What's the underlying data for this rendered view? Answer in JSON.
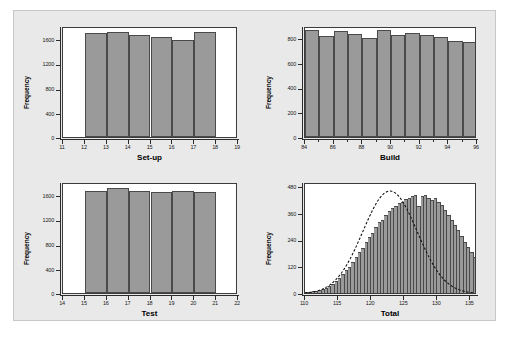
{
  "figure": {
    "panel_background": "#e9e9e9",
    "plot_background": "#ffffff",
    "bar_fill": "#9a9a9a",
    "bar_edge": "#4a4a4a",
    "axis_color": "#2b2b2b"
  },
  "chart_data": [
    {
      "type": "bar",
      "title": "",
      "xlabel": "Set-up",
      "ylabel": "Frequency",
      "xlim": [
        11,
        19
      ],
      "ylim": [
        0,
        1800
      ],
      "xticks": [
        11,
        12,
        13,
        14,
        15,
        16,
        17,
        18,
        19
      ],
      "xtick_labels": [
        "11",
        "12",
        "13",
        "14",
        "15",
        "16",
        "17",
        "18",
        "19"
      ],
      "yticks": [
        0,
        400,
        800,
        1200,
        1600
      ],
      "ytick_labels": [
        "0",
        "400",
        "800",
        "1200",
        "1600"
      ],
      "bin_edges": [
        12,
        13,
        14,
        15,
        16,
        17,
        18
      ],
      "categories": [
        "12-13",
        "13-14",
        "14-15",
        "15-16",
        "16-17",
        "17-18"
      ],
      "values": [
        1690,
        1705,
        1650,
        1630,
        1570,
        1700
      ],
      "grid": false,
      "legend": "none"
    },
    {
      "type": "bar",
      "title": "",
      "xlabel": "Build",
      "ylabel": "Frequency",
      "xlim": [
        84,
        96
      ],
      "ylim": [
        0,
        900
      ],
      "xticks": [
        84,
        85,
        86,
        87,
        88,
        89,
        90,
        91,
        92,
        93,
        94,
        95,
        96
      ],
      "xtick_labels": [
        "84",
        "",
        "86",
        "",
        "88",
        "",
        "90",
        "",
        "92",
        "",
        "94",
        "",
        "96"
      ],
      "yticks": [
        0,
        200,
        400,
        600,
        800
      ],
      "ytick_labels": [
        "0",
        "200",
        "400",
        "600",
        "800"
      ],
      "bin_edges": [
        84,
        85,
        86,
        87,
        88,
        89,
        90,
        91,
        92,
        93,
        94,
        95,
        96
      ],
      "categories": [
        "84-85",
        "85-86",
        "86-87",
        "87-88",
        "88-89",
        "89-90",
        "90-91",
        "91-92",
        "92-93",
        "93-94",
        "94-95",
        "95-96"
      ],
      "values": [
        872,
        823,
        858,
        838,
        806,
        872,
        828,
        845,
        828,
        812,
        782,
        768
      ],
      "grid": false,
      "legend": "none"
    },
    {
      "type": "bar",
      "title": "",
      "xlabel": "Test",
      "ylabel": "Frequency",
      "xlim": [
        14,
        22
      ],
      "ylim": [
        0,
        1800
      ],
      "xticks": [
        14,
        15,
        16,
        17,
        18,
        19,
        20,
        21,
        22
      ],
      "xtick_labels": [
        "14",
        "15",
        "16",
        "17",
        "18",
        "19",
        "20",
        "21",
        "22"
      ],
      "yticks": [
        0,
        400,
        800,
        1200,
        1600
      ],
      "ytick_labels": [
        "0",
        "400",
        "800",
        "1200",
        "1600"
      ],
      "bin_edges": [
        15,
        16,
        17,
        18,
        19,
        20,
        21
      ],
      "categories": [
        "15-16",
        "16-17",
        "17-18",
        "18-19",
        "19-20",
        "20-21"
      ],
      "values": [
        1650,
        1700,
        1660,
        1645,
        1650,
        1635
      ],
      "grid": false,
      "legend": "none"
    },
    {
      "type": "bar",
      "title": "",
      "xlabel": "Total",
      "ylabel": "Frequency",
      "xlim": [
        110,
        136
      ],
      "ylim": [
        0,
        500
      ],
      "xticks": [
        110,
        115,
        120,
        125,
        130,
        135
      ],
      "xtick_labels": [
        "110",
        "115",
        "120",
        "125",
        "130",
        "135"
      ],
      "yticks": [
        0,
        120,
        240,
        360,
        480
      ],
      "ytick_labels": [
        "0",
        "120",
        "240",
        "360",
        "480"
      ],
      "bin_width": 0.5,
      "bin_start": 110.0,
      "values": [
        4,
        6,
        8,
        11,
        14,
        18,
        24,
        31,
        40,
        52,
        66,
        84,
        105,
        118,
        140,
        160,
        183,
        205,
        228,
        252,
        272,
        296,
        318,
        330,
        352,
        368,
        382,
        392,
        404,
        412,
        424,
        430,
        436,
        442,
        390,
        436,
        440,
        428,
        420,
        430,
        412,
        396,
        376,
        352,
        330,
        306,
        282,
        258,
        232,
        208,
        184,
        160,
        138,
        118,
        98,
        80,
        64,
        50,
        38,
        28,
        20,
        14,
        9,
        6,
        4,
        2
      ],
      "overlay_curve": {
        "type": "normal",
        "style": "dashed",
        "color": "#111111",
        "mean": 123.0,
        "peak": 468
      },
      "grid": false,
      "legend": "none"
    }
  ]
}
